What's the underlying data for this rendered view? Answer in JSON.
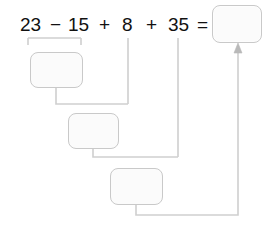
{
  "problem": {
    "expression_tokens": [
      {
        "text": "23",
        "x": 20,
        "y": 15
      },
      {
        "text": "−",
        "x": 50,
        "y": 15
      },
      {
        "text": "15",
        "x": 68,
        "y": 15
      },
      {
        "text": "+",
        "x": 99,
        "y": 15
      },
      {
        "text": "8",
        "x": 122,
        "y": 15
      },
      {
        "text": "+",
        "x": 146,
        "y": 15
      },
      {
        "text": "35",
        "x": 168,
        "y": 15
      },
      {
        "text": "=",
        "x": 197,
        "y": 15
      }
    ],
    "full_expression": "23 − 15 + 8 + 35 =",
    "operands": [
      "23",
      "15",
      "8",
      "35"
    ],
    "operators": [
      "−",
      "+",
      "+"
    ]
  },
  "answer_box": {
    "label": "",
    "value": "",
    "placeholder": "",
    "x": 212,
    "y": 5,
    "w": 50,
    "h": 38
  },
  "step_boxes": [
    {
      "id": "step-1",
      "label": "",
      "value": "",
      "placeholder": "",
      "x": 30,
      "y": 52,
      "w": 53,
      "h": 36
    },
    {
      "id": "step-2",
      "label": "",
      "value": "",
      "placeholder": "",
      "x": 68,
      "y": 113,
      "w": 51,
      "h": 36
    },
    {
      "id": "step-3",
      "label": "",
      "value": "",
      "placeholder": "",
      "x": 110,
      "y": 168,
      "w": 53,
      "h": 37
    }
  ],
  "colors": {
    "text": "#111111",
    "line": "#cfcfcf",
    "box_fill": "#fbfbfb",
    "box_border": "#c9c9c9",
    "background": "#ffffff"
  },
  "connectors": {
    "bracket_1": {
      "left_x": 28,
      "right_x": 81,
      "y": 38,
      "tick_height": 7
    },
    "drop_8": {
      "x": 128,
      "y_top": 38,
      "y_bottom": 104
    },
    "drop_35": {
      "x": 178,
      "y_top": 38,
      "y_bottom": 157
    },
    "join_1": {
      "from_x": 56,
      "from_y": 88,
      "to_x": 128,
      "to_y": 104
    },
    "join_2": {
      "from_x": 93,
      "from_y": 149,
      "to_x": 178,
      "to_y": 157
    },
    "join_3": {
      "from_x": 136,
      "from_y": 205,
      "to_x": 238,
      "to_y": 215
    },
    "arrow_to_answer": {
      "x": 238,
      "y_bottom": 215,
      "y_top": 46
    }
  }
}
